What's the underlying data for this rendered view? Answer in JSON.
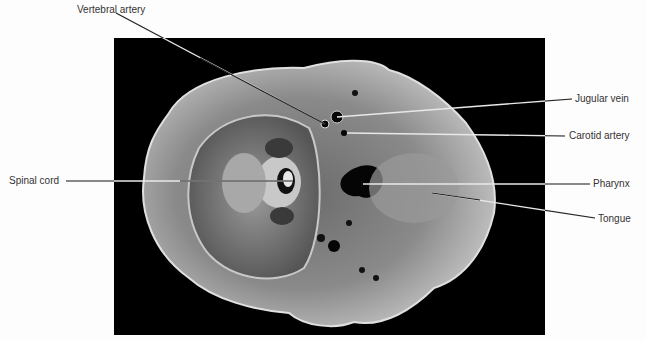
{
  "figure": {
    "background_color": "#000000",
    "label_color": "#333333",
    "labels": [
      {
        "id": "vertebral-artery",
        "text": "Vertebral artery",
        "x": 77,
        "y": 4
      },
      {
        "id": "jugular-vein",
        "text": "Jugular vein",
        "x": 575,
        "y": 93
      },
      {
        "id": "carotid-artery",
        "text": "Carotid artery",
        "x": 569,
        "y": 130
      },
      {
        "id": "spinal-cord",
        "text": "Spinal cord",
        "x": 9,
        "y": 175
      },
      {
        "id": "pharynx",
        "text": "Pharynx",
        "x": 593,
        "y": 178
      },
      {
        "id": "tongue",
        "text": "Tongue",
        "x": 598,
        "y": 213
      }
    ]
  }
}
